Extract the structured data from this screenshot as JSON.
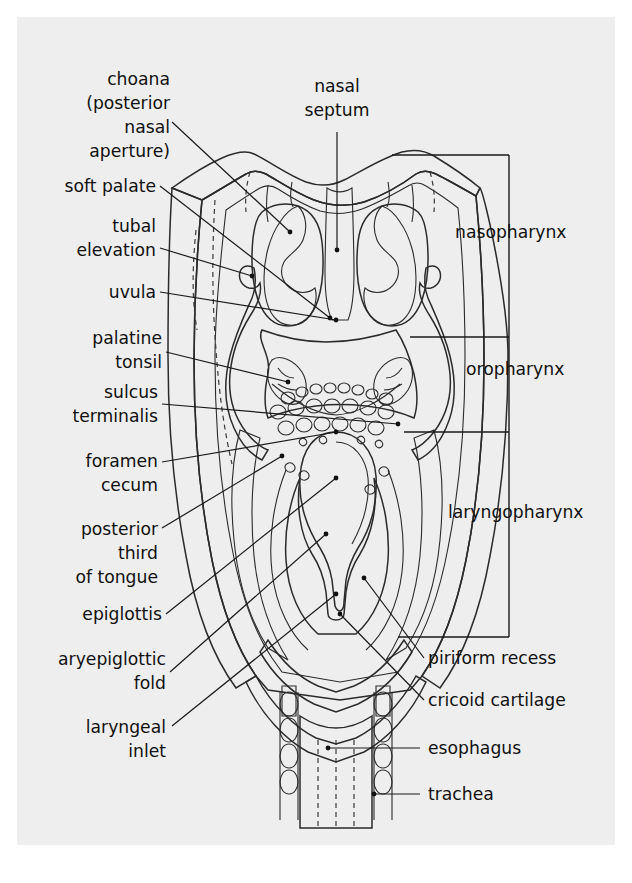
{
  "figure": {
    "type": "anatomical-diagram",
    "page_background": "#eeeeee",
    "outer_background": "#ffffff",
    "ink_color": "#1a1a1a",
    "tissue_fill_mid": "#949494",
    "tissue_fill_light": "#a8a8a8",
    "tissue_fill_dark": "#7e7e7e",
    "tissue_fill_pale": "#bdbdbd"
  },
  "labels_left": [
    {
      "id": "choana",
      "text_lines": [
        "choana",
        "(posterior",
        "nasal",
        "aperture)"
      ],
      "anchor": "end"
    },
    {
      "id": "soft-palate",
      "text_lines": [
        "soft palate"
      ],
      "anchor": "end"
    },
    {
      "id": "tubal-elevation",
      "text_lines": [
        "tubal",
        "elevation"
      ],
      "anchor": "end"
    },
    {
      "id": "uvula",
      "text_lines": [
        "uvula"
      ],
      "anchor": "end"
    },
    {
      "id": "palatine-tonsil",
      "text_lines": [
        "palatine",
        "tonsil"
      ],
      "anchor": "end"
    },
    {
      "id": "sulcus-terminalis",
      "text_lines": [
        "sulcus",
        "terminalis"
      ],
      "anchor": "end"
    },
    {
      "id": "foramen-cecum",
      "text_lines": [
        "foramen",
        "cecum"
      ],
      "anchor": "end"
    },
    {
      "id": "posterior-third-of-tongue",
      "text_lines": [
        "posterior",
        "third",
        "of tongue"
      ],
      "anchor": "end"
    },
    {
      "id": "epiglottis",
      "text_lines": [
        "epiglottis"
      ],
      "anchor": "end"
    },
    {
      "id": "aryepiglottic-fold",
      "text_lines": [
        "aryepiglottic",
        "fold"
      ],
      "anchor": "end"
    },
    {
      "id": "laryngeal-inlet",
      "text_lines": [
        "laryngeal",
        "inlet"
      ],
      "anchor": "end"
    }
  ],
  "labels_top": [
    {
      "id": "nasal-septum",
      "text_lines": [
        "nasal",
        "septum"
      ],
      "anchor": "middle"
    }
  ],
  "labels_right": [
    {
      "id": "nasopharynx",
      "text_lines": [
        "nasopharynx"
      ],
      "anchor": "start"
    },
    {
      "id": "oropharynx",
      "text_lines": [
        "oropharynx"
      ],
      "anchor": "start"
    },
    {
      "id": "laryngopharynx",
      "text_lines": [
        "laryngopharynx"
      ],
      "anchor": "start"
    },
    {
      "id": "piriform-recess",
      "text_lines": [
        "piriform recess"
      ],
      "anchor": "start"
    },
    {
      "id": "cricoid-cartilage",
      "text_lines": [
        "cricoid cartilage"
      ],
      "anchor": "start"
    },
    {
      "id": "esophagus",
      "text_lines": [
        "esophagus"
      ],
      "anchor": "start"
    },
    {
      "id": "trachea",
      "text_lines": [
        "trachea"
      ],
      "anchor": "start"
    }
  ],
  "text": {
    "choana_1": "choana",
    "choana_2": "(posterior",
    "choana_3": "nasal",
    "choana_4": "aperture)",
    "soft_palate": "soft palate",
    "tubal_1": "tubal",
    "tubal_2": "elevation",
    "uvula": "uvula",
    "palatine_1": "palatine",
    "palatine_2": "tonsil",
    "sulcus_1": "sulcus",
    "sulcus_2": "terminalis",
    "foramen_1": "foramen",
    "foramen_2": "cecum",
    "posterior_1": "posterior",
    "posterior_2": "third",
    "posterior_3": "of tongue",
    "epiglottis": "epiglottis",
    "aryepiglottic_1": "aryepiglottic",
    "aryepiglottic_2": "fold",
    "laryngeal_1": "laryngeal",
    "laryngeal_2": "inlet",
    "nasal_septum_1": "nasal",
    "nasal_septum_2": "septum",
    "nasopharynx": "nasopharynx",
    "oropharynx": "oropharynx",
    "laryngopharynx": "laryngopharynx",
    "piriform_recess": "piriform recess",
    "cricoid_cartilage": "cricoid cartilage",
    "esophagus": "esophagus",
    "trachea": "trachea"
  }
}
